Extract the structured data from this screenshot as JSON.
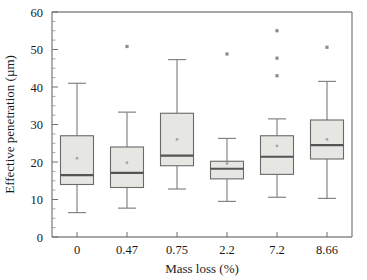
{
  "chart_data": {
    "type": "box",
    "title": "",
    "xlabel": "Mass loss (%)",
    "ylabel": "Effective penetration (µm)",
    "categories": [
      "0",
      "0.47",
      "0.75",
      "2.2",
      "7.2",
      "8.66"
    ],
    "ylim": [
      0,
      60
    ],
    "yticks": [
      0,
      10,
      20,
      30,
      40,
      50,
      60
    ],
    "ytick_labels": [
      "0",
      "10",
      "20",
      "30",
      "40",
      "50",
      "60"
    ],
    "yticks_minor_step": 2.5,
    "grid": false,
    "legend": null,
    "colors": {
      "box_fill": "#e6e6e3",
      "box_edge": "#6a6a6a",
      "median": "#545454",
      "whisker": "#7a7a7a",
      "mean": "#a8a8a8",
      "outlier": "#8c8c8c",
      "frame": "#8a8a8a",
      "text": "#1a1a1a",
      "background": "#ffffff"
    },
    "boxes": [
      {
        "category": "0",
        "whisker_low": 6.5,
        "q1": 14.0,
        "median": 16.5,
        "q3": 27.0,
        "whisker_high": 41.0,
        "mean": 21.0,
        "outliers": []
      },
      {
        "category": "0.47",
        "whisker_low": 7.7,
        "q1": 13.2,
        "median": 17.1,
        "q3": 24.0,
        "whisker_high": 33.3,
        "mean": 19.8,
        "outliers": [
          50.8
        ]
      },
      {
        "category": "0.75",
        "whisker_low": 12.8,
        "q1": 19.0,
        "median": 21.7,
        "q3": 33.0,
        "whisker_high": 47.3,
        "mean": 26.0,
        "outliers": []
      },
      {
        "category": "2.2",
        "whisker_low": 9.5,
        "q1": 15.5,
        "median": 18.2,
        "q3": 20.2,
        "whisker_high": 26.3,
        "mean": 19.6,
        "outliers": [
          48.8
        ]
      },
      {
        "category": "7.2",
        "whisker_low": 10.6,
        "q1": 16.7,
        "median": 21.4,
        "q3": 27.0,
        "whisker_high": 31.5,
        "mean": 24.3,
        "outliers": [
          55.0,
          47.7,
          43.0
        ]
      },
      {
        "category": "8.66",
        "whisker_low": 10.3,
        "q1": 20.8,
        "median": 24.5,
        "q3": 31.2,
        "whisker_high": 41.5,
        "mean": 26.0,
        "outliers": [
          50.6
        ]
      }
    ]
  }
}
